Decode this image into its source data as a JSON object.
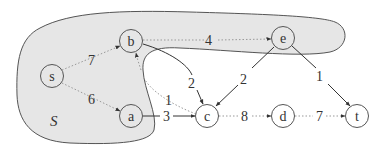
{
  "diagram": {
    "region": {
      "label": "S",
      "fill": "#e6e6e6",
      "stroke": "#555555"
    },
    "nodes": [
      {
        "id": "s",
        "label": "s",
        "x": 52,
        "y": 76
      },
      {
        "id": "b",
        "label": "b",
        "x": 131,
        "y": 41
      },
      {
        "id": "e",
        "label": "e",
        "x": 283,
        "y": 38
      },
      {
        "id": "a",
        "label": "a",
        "x": 131,
        "y": 116
      },
      {
        "id": "c",
        "label": "c",
        "x": 207,
        "y": 116
      },
      {
        "id": "d",
        "label": "d",
        "x": 283,
        "y": 116
      },
      {
        "id": "t",
        "label": "t",
        "x": 357,
        "y": 116
      }
    ],
    "edges": [
      {
        "from": "s",
        "to": "b",
        "weight": "7",
        "style": "dotted"
      },
      {
        "from": "s",
        "to": "a",
        "weight": "6",
        "style": "dotted"
      },
      {
        "from": "b",
        "to": "e",
        "weight": "4",
        "style": "dotted"
      },
      {
        "from": "b",
        "to": "c",
        "weight": "2",
        "style": "solid"
      },
      {
        "from": "c",
        "to": "b",
        "weight": "1",
        "style": "dotted"
      },
      {
        "from": "e",
        "to": "c",
        "weight": "2",
        "style": "solid"
      },
      {
        "from": "e",
        "to": "t",
        "weight": "1",
        "style": "solid"
      },
      {
        "from": "a",
        "to": "c",
        "weight": "3",
        "style": "solid"
      },
      {
        "from": "c",
        "to": "d",
        "weight": "8",
        "style": "dotted"
      },
      {
        "from": "d",
        "to": "t",
        "weight": "7",
        "style": "dotted"
      }
    ]
  }
}
